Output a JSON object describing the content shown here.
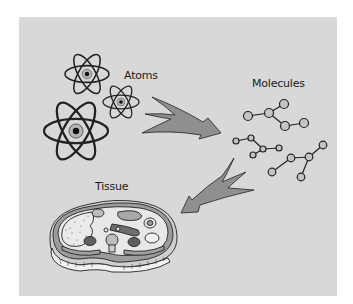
{
  "figure": {
    "labels": {
      "atoms": "Atoms",
      "molecules": "Molecules",
      "tissue": "Tissue"
    },
    "colors": {
      "background": "#d8d8d8",
      "arrow_fill": "#8f8f8f",
      "stroke": "#222222",
      "atom_nucleus_halo": "#b5b5b5",
      "molecule_atom_fill": "#c4c4c4",
      "organ_dark": "#6e6e6e",
      "organ_mid": "#a0a0a0",
      "organ_light": "#e4e4e4"
    },
    "icons": [
      "atom-icon",
      "molecule-icon",
      "arrow-icon",
      "tissue-cross-section-icon"
    ]
  }
}
